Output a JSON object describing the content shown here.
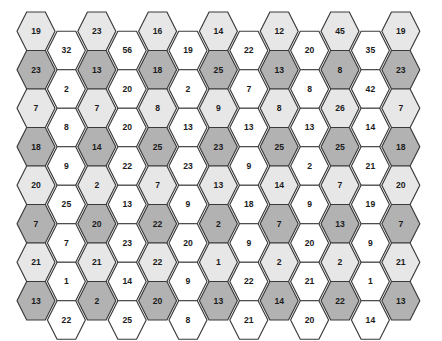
{
  "figure": {
    "name": "hexagonal-number-grid",
    "type": "hex-grid",
    "background_color": "#ffffff",
    "columns": 13,
    "rows_per_column": 8,
    "orientation": "flat-top",
    "stroke_color": "#3a3a3a",
    "label_color": "#1b1b1b"
  },
  "palette": {
    "light_gray": "#e7e7e7",
    "dark_gray": "#b2b2b2",
    "white": "#ffffff"
  },
  "geometry": {
    "origin_x": 17,
    "origin_y": 12,
    "column_step": 30.4,
    "row_step": 38.5,
    "hex_width": 38,
    "hex_height": 38.5,
    "odd_column_offset": 0,
    "even_column_offset": 19.25
  },
  "chart_data": {
    "type": "table",
    "title": "",
    "xlabel": "",
    "ylabel": "",
    "columns": [
      {
        "index": 1,
        "shaded": true,
        "values": [
          19,
          23,
          7,
          18,
          20,
          7,
          21,
          13
        ],
        "fills": [
          "light_gray",
          "dark_gray",
          "light_gray",
          "dark_gray",
          "light_gray",
          "dark_gray",
          "light_gray",
          "dark_gray"
        ]
      },
      {
        "index": 2,
        "shaded": false,
        "values": [
          32,
          2,
          8,
          9,
          25,
          7,
          1,
          22
        ],
        "fills": [
          "white",
          "white",
          "white",
          "white",
          "white",
          "white",
          "white",
          "white"
        ]
      },
      {
        "index": 3,
        "shaded": true,
        "values": [
          23,
          13,
          7,
          14,
          2,
          20,
          21,
          2
        ],
        "fills": [
          "light_gray",
          "dark_gray",
          "light_gray",
          "dark_gray",
          "light_gray",
          "dark_gray",
          "light_gray",
          "dark_gray"
        ]
      },
      {
        "index": 4,
        "shaded": false,
        "values": [
          56,
          20,
          20,
          22,
          13,
          23,
          14,
          25
        ],
        "fills": [
          "white",
          "white",
          "white",
          "white",
          "white",
          "white",
          "white",
          "white"
        ]
      },
      {
        "index": 5,
        "shaded": true,
        "values": [
          16,
          18,
          8,
          25,
          7,
          22,
          22,
          20
        ],
        "fills": [
          "light_gray",
          "dark_gray",
          "light_gray",
          "dark_gray",
          "light_gray",
          "dark_gray",
          "light_gray",
          "dark_gray"
        ]
      },
      {
        "index": 6,
        "shaded": false,
        "values": [
          19,
          2,
          13,
          23,
          9,
          20,
          9,
          8
        ],
        "fills": [
          "white",
          "white",
          "white",
          "white",
          "white",
          "white",
          "white",
          "white"
        ]
      },
      {
        "index": 7,
        "shaded": true,
        "values": [
          14,
          25,
          9,
          23,
          13,
          2,
          1,
          13
        ],
        "fills": [
          "light_gray",
          "dark_gray",
          "light_gray",
          "dark_gray",
          "light_gray",
          "dark_gray",
          "light_gray",
          "dark_gray"
        ]
      },
      {
        "index": 8,
        "shaded": false,
        "values": [
          22,
          7,
          13,
          9,
          18,
          9,
          22,
          21
        ],
        "fills": [
          "white",
          "white",
          "white",
          "white",
          "white",
          "white",
          "white",
          "white"
        ]
      },
      {
        "index": 9,
        "shaded": true,
        "values": [
          12,
          13,
          8,
          25,
          14,
          7,
          2,
          14
        ],
        "fills": [
          "light_gray",
          "dark_gray",
          "light_gray",
          "dark_gray",
          "light_gray",
          "dark_gray",
          "light_gray",
          "dark_gray"
        ]
      },
      {
        "index": 10,
        "shaded": false,
        "values": [
          20,
          8,
          13,
          2,
          9,
          20,
          21,
          20
        ],
        "fills": [
          "white",
          "white",
          "white",
          "white",
          "white",
          "white",
          "white",
          "white"
        ]
      },
      {
        "index": 11,
        "shaded": true,
        "values": [
          45,
          8,
          26,
          25,
          7,
          13,
          2,
          22
        ],
        "fills": [
          "light_gray",
          "dark_gray",
          "light_gray",
          "dark_gray",
          "light_gray",
          "dark_gray",
          "light_gray",
          "dark_gray"
        ]
      },
      {
        "index": 12,
        "shaded": false,
        "values": [
          35,
          42,
          14,
          21,
          19,
          9,
          1,
          14
        ],
        "fills": [
          "white",
          "white",
          "white",
          "white",
          "white",
          "white",
          "white",
          "white"
        ]
      },
      {
        "index": 13,
        "shaded": true,
        "values": [
          19,
          23,
          7,
          18,
          20,
          7,
          21,
          13
        ],
        "fills": [
          "light_gray",
          "dark_gray",
          "light_gray",
          "dark_gray",
          "light_gray",
          "dark_gray",
          "light_gray",
          "dark_gray"
        ]
      }
    ]
  }
}
